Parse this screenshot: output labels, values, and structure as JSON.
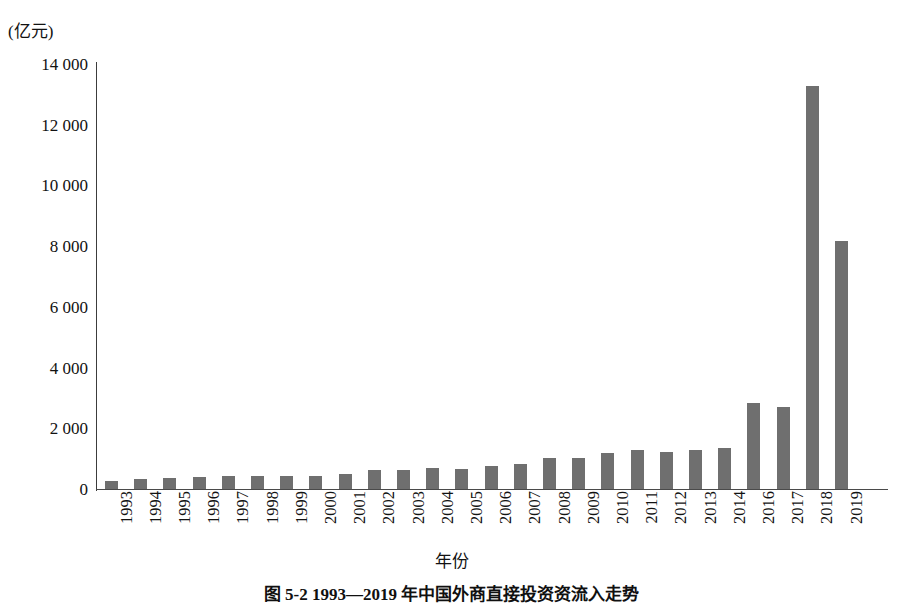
{
  "figure": {
    "unit_label": "(亿元)",
    "axis_title_x": "年份",
    "caption": "图 5-2  1993—2019 年中国外商直接投资资流入走势"
  },
  "chart_data": {
    "type": "bar",
    "title": "图 5-2  1993—2019 年中国外商直接投资资流入走势",
    "xlabel": "年份",
    "ylabel": "(亿元)",
    "ylim": [
      0,
      14000
    ],
    "yticks": [
      0,
      2000,
      4000,
      6000,
      8000,
      10000,
      12000,
      14000
    ],
    "ytick_labels": [
      "0",
      "2 000",
      "4 000",
      "6 000",
      "8 000",
      "10 000",
      "12 000",
      "14 000"
    ],
    "grid": false,
    "legend": "none",
    "bar_color": "#6f6f6f",
    "categories": [
      "1993",
      "1994",
      "1995",
      "1996",
      "1997",
      "1998",
      "1999",
      "2000",
      "2001",
      "2002",
      "2003",
      "2004",
      "2005",
      "2006",
      "2007",
      "2008",
      "2009",
      "2010",
      "2011",
      "2012",
      "2013",
      "2014",
      "2016",
      "2017",
      "2018",
      "2019"
    ],
    "values": [
      280,
      340,
      350,
      410,
      430,
      440,
      420,
      440,
      500,
      610,
      620,
      680,
      670,
      760,
      840,
      1020,
      1020,
      1180,
      1280,
      1230,
      1280,
      1350,
      2830,
      2700,
      13270,
      8160
    ]
  }
}
